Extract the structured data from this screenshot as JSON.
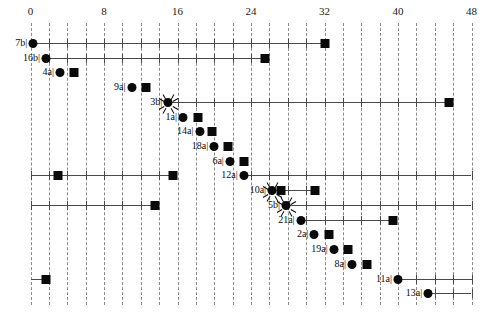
{
  "chart_data": {
    "type": "bar",
    "title": "",
    "xlabel": "",
    "ylabel": "",
    "xlim": [
      0,
      48
    ],
    "grid": true,
    "grid_step": 2,
    "legend": "none",
    "axis": {
      "ticks": [
        0,
        8,
        16,
        24,
        32,
        40,
        48
      ],
      "tick_labels": [
        "0",
        "8",
        "16",
        "24",
        "32",
        "40",
        "48"
      ],
      "minor_step": 2
    },
    "categories": [
      "7b",
      "16b",
      "4a",
      "9a",
      "3b",
      "1a",
      "14a",
      "18a",
      "6a",
      "12a",
      "10a",
      "5b",
      "21a",
      "2a",
      "19a",
      "8a",
      "11a",
      "13a"
    ],
    "series": [
      {
        "name": "start",
        "values": [
          0.3,
          1.7,
          3.2,
          11.0,
          15.0,
          16.6,
          18.4,
          20.0,
          21.7,
          23.2,
          26.3,
          27.8,
          29.4,
          30.9,
          33.0,
          35.0,
          40.0,
          43.3
        ]
      },
      {
        "name": "finish",
        "values": [
          32.0,
          25.5,
          4.7,
          12.6,
          45.6,
          18.2,
          19.8,
          21.5,
          23.2,
          23.2,
          31.0,
          27.8,
          39.5,
          32.5,
          34.6,
          36.6,
          40.0,
          43.3
        ]
      }
    ],
    "tasks": [
      {
        "label": "7b",
        "start": 0.3,
        "end": 32.0,
        "line": true,
        "ticks": true,
        "start_marker": "circle",
        "end_marker": "square",
        "burst": false
      },
      {
        "label": "16b",
        "start": 1.7,
        "end": 25.5,
        "line": true,
        "ticks": true,
        "start_marker": "circle",
        "end_marker": "square",
        "burst": false
      },
      {
        "label": "4a",
        "start": 3.2,
        "end": 4.7,
        "line": false,
        "ticks": false,
        "start_marker": "circle",
        "end_marker": "square",
        "burst": false
      },
      {
        "label": "9a",
        "start": 11.0,
        "end": 12.6,
        "line": false,
        "ticks": false,
        "start_marker": "circle",
        "end_marker": "square",
        "burst": false
      },
      {
        "label": "3b",
        "start": 15.0,
        "end": 45.6,
        "line": true,
        "ticks": true,
        "start_marker": "circle",
        "end_marker": "square",
        "burst": true
      },
      {
        "label": "1a",
        "start": 16.6,
        "end": 18.2,
        "line": false,
        "ticks": false,
        "start_marker": "circle",
        "end_marker": "square",
        "burst": false
      },
      {
        "label": "14a",
        "start": 18.4,
        "end": 19.8,
        "line": false,
        "ticks": false,
        "start_marker": "circle",
        "end_marker": "square",
        "burst": false
      },
      {
        "label": "18a",
        "start": 20.0,
        "end": 21.5,
        "line": false,
        "ticks": false,
        "start_marker": "circle",
        "end_marker": "square",
        "burst": false
      },
      {
        "label": "6a",
        "start": 21.7,
        "end": 23.2,
        "line": false,
        "ticks": false,
        "start_marker": "circle",
        "end_marker": "square",
        "burst": false
      },
      {
        "label": "12a",
        "start": 23.2,
        "end": 48.0,
        "line": true,
        "ticks": true,
        "start_marker": "circle",
        "end_marker": "none",
        "burst": false
      },
      {
        "label": "10a",
        "start": 26.3,
        "end": 31.0,
        "line": true,
        "ticks": true,
        "start_marker": "circle",
        "end_marker": "square",
        "burst": true,
        "mid_square": 27.3
      },
      {
        "label": "5b",
        "start": 27.8,
        "end": 48.0,
        "line": true,
        "ticks": true,
        "start_marker": "circle",
        "end_marker": "none",
        "burst": true
      },
      {
        "label": "21a",
        "start": 29.4,
        "end": 39.5,
        "line": true,
        "ticks": true,
        "start_marker": "circle",
        "end_marker": "square",
        "burst": false
      },
      {
        "label": "2a",
        "start": 30.9,
        "end": 32.5,
        "line": false,
        "ticks": false,
        "start_marker": "circle",
        "end_marker": "square",
        "burst": false
      },
      {
        "label": "19a",
        "start": 33.0,
        "end": 34.6,
        "line": false,
        "ticks": false,
        "start_marker": "circle",
        "end_marker": "square",
        "burst": false
      },
      {
        "label": "8a",
        "start": 35.0,
        "end": 36.6,
        "line": false,
        "ticks": false,
        "start_marker": "circle",
        "end_marker": "square",
        "burst": false
      },
      {
        "label": "11a",
        "start": 40.0,
        "end": 48.0,
        "line": true,
        "ticks": true,
        "start_marker": "circle",
        "end_marker": "none",
        "burst": false
      },
      {
        "label": "13a",
        "start": 43.3,
        "end": 48.0,
        "line": true,
        "ticks": true,
        "start_marker": "circle",
        "end_marker": "none",
        "burst": false
      }
    ],
    "extra_bars": [
      {
        "row_index": 9,
        "label": "",
        "start": 0.0,
        "end": 15.5,
        "line": true,
        "ticks": true,
        "squares": [
          3.0,
          15.5
        ]
      },
      {
        "row_index": 11,
        "label": "",
        "start": 0.0,
        "end": 13.5,
        "line": true,
        "ticks": true,
        "squares": [
          13.5
        ]
      },
      {
        "row_index": 16,
        "label": "",
        "start": 0.0,
        "end": 1.7,
        "line": true,
        "ticks": false,
        "squares": [
          1.7
        ]
      }
    ],
    "colors": {
      "marker": "#0a0a0a",
      "line": "#4a4a4a",
      "grid": "#8a8a8a",
      "text": "#1a1a1a",
      "background": "#ffffff"
    }
  }
}
